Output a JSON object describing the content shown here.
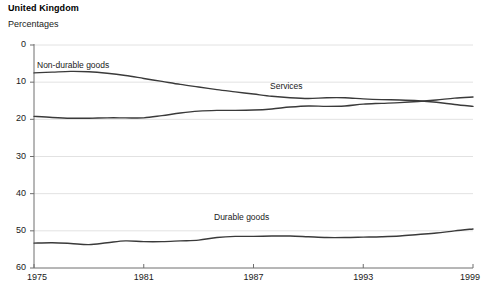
{
  "header": {
    "title": "United Kingdom",
    "subtitle": "Percentages"
  },
  "footnote": {
    "text": ""
  },
  "axis": {
    "y_ticks": [
      "60",
      "50",
      "40",
      "30",
      "20",
      "10",
      "0"
    ],
    "x_ticks": [
      "1975",
      "1981",
      "1987",
      "1993",
      "1999"
    ]
  },
  "series_labels": {
    "non_durable": "Non-durable goods",
    "services": "Services",
    "durable": "Durable goods"
  },
  "colors": {
    "line": "#3a3a3a",
    "grid": "#e2e2e2",
    "axis": "#6e6e6e",
    "text": "#1a1a1a"
  },
  "chart_data": {
    "type": "line",
    "title": "United Kingdom",
    "subtitle": "Percentages",
    "xlabel": "",
    "ylabel": "Percentages",
    "ylim": [
      0,
      60
    ],
    "xlim": [
      1975,
      1999
    ],
    "yticks": [
      0,
      10,
      20,
      30,
      40,
      50,
      60
    ],
    "xticks": [
      1975,
      1981,
      1987,
      1993,
      1999
    ],
    "grid": true,
    "legend": "inline-labels",
    "x": [
      1975,
      1976,
      1977,
      1978,
      1979,
      1980,
      1981,
      1982,
      1983,
      1984,
      1985,
      1986,
      1987,
      1988,
      1989,
      1990,
      1991,
      1992,
      1993,
      1994,
      1995,
      1996,
      1997,
      1998,
      1999
    ],
    "series": [
      {
        "name": "Non-durable goods",
        "values": [
          52.5,
          52.7,
          52.9,
          52.8,
          52.4,
          51.8,
          51.0,
          50.2,
          49.4,
          48.7,
          48.0,
          47.4,
          46.8,
          46.2,
          45.8,
          45.6,
          45.8,
          45.8,
          45.5,
          45.3,
          45.2,
          45.0,
          44.6,
          44.0,
          43.5
        ]
      },
      {
        "name": "Services",
        "values": [
          40.8,
          40.5,
          40.3,
          40.3,
          40.4,
          40.4,
          40.4,
          41.0,
          41.7,
          42.2,
          42.4,
          42.4,
          42.5,
          42.8,
          43.3,
          43.6,
          43.5,
          43.6,
          44.1,
          44.3,
          44.5,
          44.8,
          45.2,
          45.7,
          46.0
        ]
      },
      {
        "name": "Durable goods",
        "values": [
          6.7,
          6.8,
          6.6,
          6.3,
          6.8,
          7.3,
          7.1,
          7.1,
          7.3,
          7.5,
          8.2,
          8.5,
          8.5,
          8.6,
          8.6,
          8.4,
          8.2,
          8.2,
          8.3,
          8.4,
          8.6,
          9.0,
          9.4,
          10.0,
          10.5
        ]
      }
    ]
  }
}
